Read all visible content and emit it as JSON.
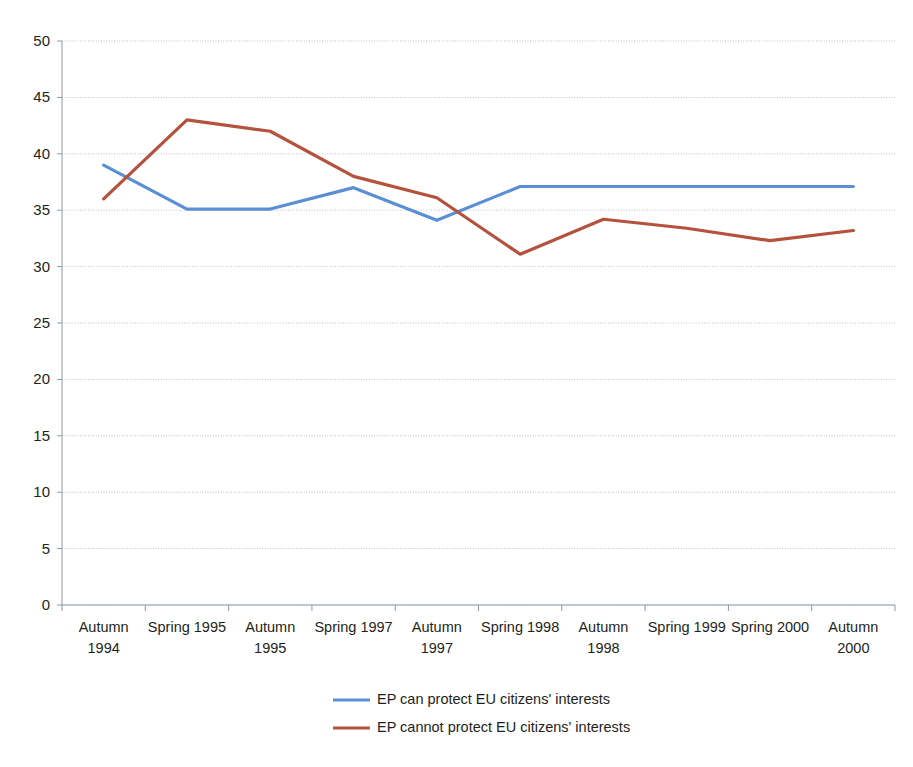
{
  "chart_data": {
    "type": "line",
    "title": "",
    "subtitle": "",
    "xlabel": "",
    "ylabel": "",
    "ylim": [
      0,
      50
    ],
    "ytick_step": 5,
    "yticks": [
      "0",
      "5",
      "10",
      "15",
      "20",
      "25",
      "30",
      "35",
      "40",
      "45",
      "50"
    ],
    "grid": true,
    "legend_position": "bottom",
    "categories": [
      "Autumn 1994",
      "Spring 1995",
      "Autumn 1995",
      "Spring 1997",
      "Autumn 1997",
      "Spring 1998",
      "Autumn 1998",
      "Spring 1999",
      "Spring 2000",
      "Autumn 2000"
    ],
    "category_lines": [
      [
        "Autumn",
        "1994"
      ],
      [
        "Spring 1995"
      ],
      [
        "Autumn",
        "1995"
      ],
      [
        "Spring 1997"
      ],
      [
        "Autumn",
        "1997"
      ],
      [
        "Spring 1998"
      ],
      [
        "Autumn",
        "1998"
      ],
      [
        "Spring 1999"
      ],
      [
        "Spring 2000"
      ],
      [
        "Autumn",
        "2000"
      ]
    ],
    "series": [
      {
        "name": "EP can protect EU citizens' interests",
        "color": "#5B8FD4",
        "values": [
          39.0,
          35.1,
          35.1,
          37.0,
          34.1,
          37.1,
          37.1,
          37.1,
          37.1,
          37.1
        ]
      },
      {
        "name": "EP cannot protect EU citizens' interests",
        "color": "#B4523E",
        "values": [
          36.0,
          43.0,
          42.0,
          38.0,
          36.1,
          31.1,
          34.2,
          33.4,
          32.3,
          33.2
        ]
      }
    ]
  },
  "legend": {
    "items": [
      {
        "label": "EP can protect EU citizens' interests",
        "color": "#5B8FD4"
      },
      {
        "label": "EP cannot protect EU citizens' interests",
        "color": "#B4523E"
      }
    ]
  },
  "colors": {
    "series_blue": "#5B8FD4",
    "series_red": "#B4523E",
    "gridline": "#9aa4ae",
    "axis": "#8d99a6",
    "text": "#231f20",
    "background": "#ffffff"
  }
}
